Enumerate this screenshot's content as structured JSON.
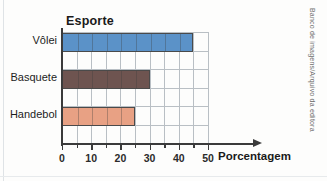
{
  "chart_data": {
    "type": "bar",
    "orientation": "horizontal",
    "title": "Esporte",
    "xlabel": "Porcentagem",
    "ylabel": "Esporte",
    "categories": [
      "Vôlei",
      "Basquete",
      "Handebol"
    ],
    "values": [
      45,
      30,
      25
    ],
    "series": [
      {
        "name": "Porcentagem",
        "values": [
          45,
          30,
          25
        ]
      }
    ],
    "bar_colors": [
      "#5b92c8",
      "#6e5450",
      "#e8a184"
    ],
    "xlim": [
      0,
      50
    ],
    "xticks": [
      0,
      10,
      20,
      30,
      40,
      50
    ],
    "xtick_labels": [
      "0",
      "10",
      "20",
      "30",
      "40",
      "50"
    ],
    "minor_tick_step": 5,
    "grid": true,
    "grid_axis": "x",
    "legend": false,
    "axis_arrow": true
  },
  "credit": {
    "text": "Banco de imagens/Arquivo da editora"
  },
  "colors": {
    "volei": "#5b92c8",
    "basquete": "#6e5450",
    "handebol": "#e8a184",
    "axis": "#3b3b3b",
    "grid": "#b9bfc4",
    "text": "#1a1a1a"
  }
}
